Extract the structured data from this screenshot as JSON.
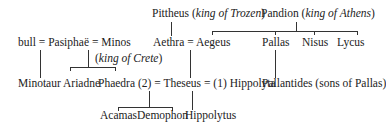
{
  "diagram": {
    "type": "family-tree",
    "row1": {
      "pittheus": {
        "name": "Pittheus",
        "title": "king of Trozen"
      },
      "pandion": {
        "name": "Pandion",
        "title": "king of Athens"
      }
    },
    "row2": {
      "bull": "bull",
      "eq1": "=",
      "pasiphae": "Pasiphaë",
      "eq2": "=",
      "minos": "Minos",
      "minos_title": "king of Crete",
      "aethra": "Aethra",
      "eq3": "=",
      "aegeus": "Aegeus",
      "pallas": "Pallas",
      "nisus": "Nisus",
      "lycus": "Lycus"
    },
    "row3": {
      "minotaur": "Minotaur",
      "ariadne": "Ariadne",
      "phaedra": "Phaedra",
      "phaedra_num": "(2)",
      "eq4": "=",
      "theseus": "Theseus",
      "eq5": "=",
      "hippolyta_num": "(1)",
      "hippolyta": "Hippolyta",
      "pallantides": "Pallantides (sons of Pallas)"
    },
    "row4": {
      "acamas": "Acamas",
      "demophon": "Demophon",
      "hippolytus": "Hippolytus"
    }
  }
}
